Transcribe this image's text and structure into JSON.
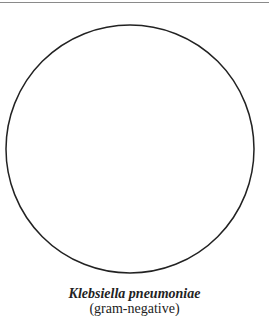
{
  "figure": {
    "shape": "circle",
    "stroke_color": "#222222",
    "fill_color": "#ffffff",
    "cx": 130,
    "cy": 149,
    "r": 124
  },
  "caption": {
    "title": "Klebsiella pneumoniae",
    "subtitle": "(gram-negative)"
  },
  "colors": {
    "rule": "#8a8a8a",
    "text": "#222222"
  }
}
